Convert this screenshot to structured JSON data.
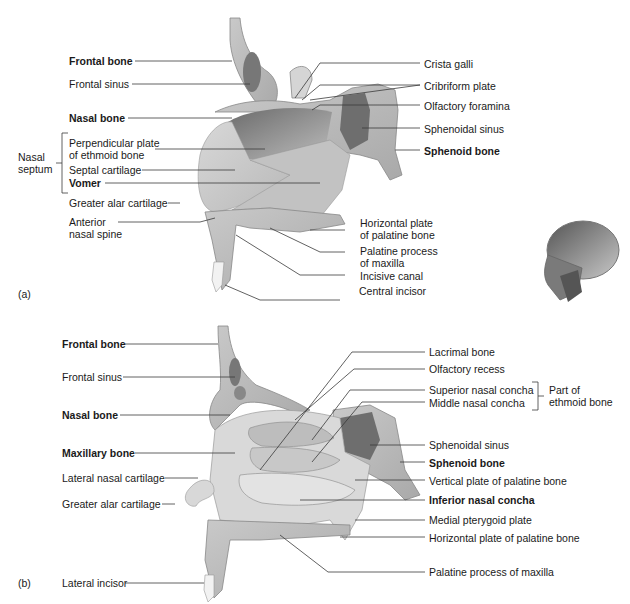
{
  "panel_a": {
    "tag": "(a)",
    "left_labels": {
      "frontal_bone": "Frontal bone",
      "frontal_sinus": "Frontal sinus",
      "nasal_bone": "Nasal bone",
      "nasal_septum_group": "Nasal\nseptum",
      "perpendicular_plate": "Perpendicular plate\nof ethmoid bone",
      "septal_cartilage": "Septal cartilage",
      "vomer": "Vomer",
      "greater_alar_cartilage": "Greater alar cartilage",
      "anterior_nasal_spine": "Anterior\nnasal spine"
    },
    "right_labels": {
      "crista_galli": "Crista galli",
      "cribriform_plate": "Cribriform plate",
      "olfactory_foramina": "Olfactory foramina",
      "sphenoidal_sinus": "Sphenoidal sinus",
      "sphenoid_bone": "Sphenoid bone",
      "horizontal_plate": "Horizontal plate\nof palatine bone",
      "palatine_process": "Palatine process\nof maxilla",
      "incisive_canal": "Incisive canal",
      "central_incisor": "Central incisor"
    }
  },
  "panel_b": {
    "tag": "(b)",
    "left_labels": {
      "frontal_bone": "Frontal bone",
      "frontal_sinus": "Frontal sinus",
      "nasal_bone": "Nasal bone",
      "maxillary_bone": "Maxillary bone",
      "lateral_nasal_cartilage": "Lateral nasal cartilage",
      "greater_alar_cartilage": "Greater alar cartilage",
      "lateral_incisor": "Lateral incisor"
    },
    "right_labels": {
      "lacrimal_bone": "Lacrimal bone",
      "olfactory_recess": "Olfactory recess",
      "superior_nasal_concha": "Superior nasal concha",
      "middle_nasal_concha": "Middle nasal concha",
      "ethmoid_group": "Part of\nethmoid bone",
      "sphenoidal_sinus": "Sphenoidal sinus",
      "sphenoid_bone": "Sphenoid bone",
      "vertical_plate": "Vertical plate of palatine bone",
      "inferior_nasal_concha": "Inferior nasal concha",
      "medial_pterygoid_plate": "Medial pterygoid plate",
      "horizontal_plate": "Horizontal plate of palatine bone",
      "palatine_process": "Palatine process of maxilla"
    }
  },
  "orientation_icon": "skull-lateral-view"
}
